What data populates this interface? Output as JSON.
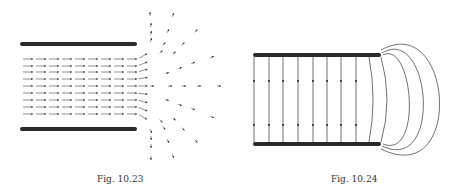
{
  "figures": [
    {
      "caption": "Fig. 10.23",
      "description": "parallel plates with field arrows fringing outward at the open end"
    },
    {
      "caption": "Fig. 10.24",
      "description": "parallel plates with vertical field lines between plates and closed loops at the edge"
    }
  ],
  "colors": {
    "plate": "#2a2a2a",
    "line": "#333333",
    "background": "#ffffff"
  }
}
